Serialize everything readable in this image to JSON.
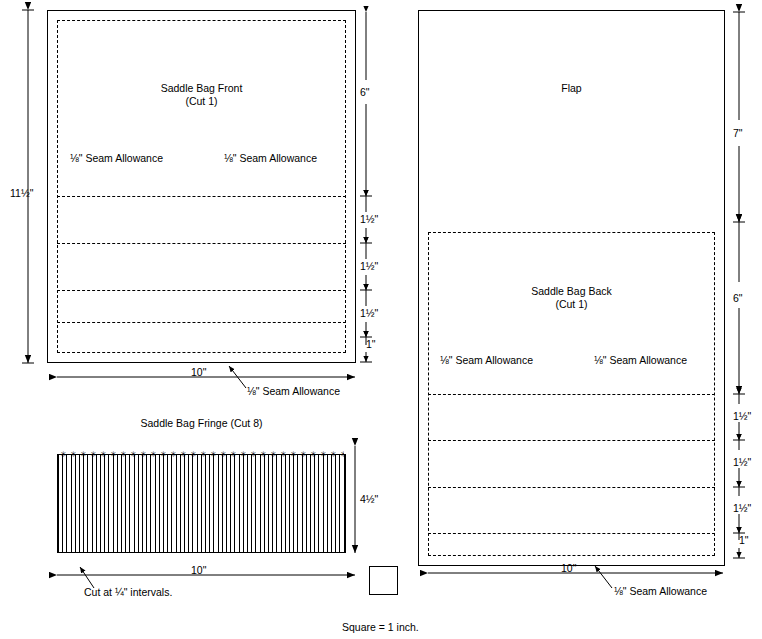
{
  "diagram": {
    "title_hidden": "Saddle Bag Pattern Layout",
    "pieces": {
      "front": {
        "label_line1": "Saddle Bag Front",
        "label_line2": "(Cut 1)",
        "seam_left": "⅛\" Seam Allowance",
        "seam_right": "⅛\" Seam Allowance",
        "seam_bottom": "⅛\" Seam Allowance",
        "dim_height": "11½\"",
        "dim_width": "10\"",
        "dim_top_section": "6\"",
        "dim_band1": "1½\"",
        "dim_band2": "1½\"",
        "dim_band3": "1½\"",
        "dim_band4": "1\""
      },
      "flap": {
        "label": "Flap",
        "dim_height": "7\""
      },
      "back": {
        "label_line1": "Saddle Bag Back",
        "label_line2": "(Cut 1)",
        "seam_left": "⅛\" Seam Allowance",
        "seam_right": "⅛\" Seam Allowance",
        "seam_bottom": "⅛\" Seam Allowance",
        "dim_height": "6\"",
        "dim_width": "10\"",
        "dim_band1": "1½\"",
        "dim_band2": "1½\"",
        "dim_band3": "1½\"",
        "dim_band4": "1\""
      },
      "fringe": {
        "title": "Saddle Bag Fringe (Cut 8)",
        "dim_height": "4½\"",
        "dim_width": "10\"",
        "note": "Cut at ¼\" intervals."
      }
    },
    "scale_note": "Square = 1 inch."
  }
}
